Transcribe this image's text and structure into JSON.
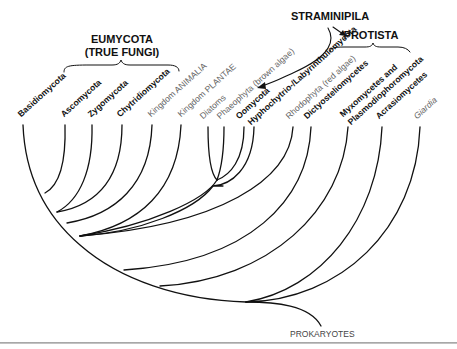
{
  "diagram": {
    "type": "phylogenetic-tree",
    "groups": {
      "eumycota_line1": "EUMYCOTA",
      "eumycota_line2": "(TRUE FUNGI)",
      "straminipila": "STRAMINIPILA",
      "protista": "PROTISTA"
    },
    "root_label": "PROKARYOTES",
    "taxa": [
      {
        "label": "Basidiomycota",
        "style": "bold"
      },
      {
        "label": "Ascomycota",
        "style": "bold"
      },
      {
        "label": "Zygomycota",
        "style": "bold"
      },
      {
        "label": "Chytridiomycota",
        "style": "bold"
      },
      {
        "label": "Kingdom ANIMALIA",
        "style": "light"
      },
      {
        "label": "Kingdom PLANTAE",
        "style": "light"
      },
      {
        "label": "Diatoms",
        "style": "light"
      },
      {
        "label": "Phaeophyta (brown algae)",
        "style": "light"
      },
      {
        "label": "Oomycota",
        "style": "bold"
      },
      {
        "label": "Hyphochytrio-/Labyrinthulomycota",
        "style": "bold"
      },
      {
        "label": "Rhodophyta (red algae)",
        "style": "light"
      },
      {
        "label": "Dictyosteliomycetes",
        "style": "bold"
      },
      {
        "label": "Myxomycetes and",
        "style": "bold"
      },
      {
        "label": "Plasmodiophoromycota",
        "style": "bold"
      },
      {
        "label": "Acrasiomycetes",
        "style": "bold"
      },
      {
        "label": "Giardia",
        "style": "light-italic"
      }
    ]
  }
}
